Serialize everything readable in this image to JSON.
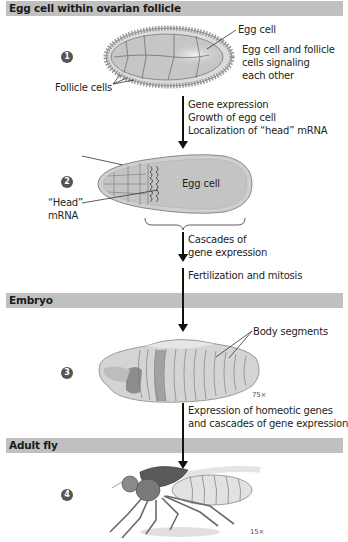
{
  "sections": [
    {
      "title": "Egg cell within ovarian follicle"
    },
    {
      "title": "Embryo"
    },
    {
      "title": "Adult fly"
    }
  ],
  "steps": [
    {
      "number": "1",
      "labels": {
        "egg_cell": "Egg cell",
        "signaling": [
          "Egg cell and follicle",
          "cells signaling",
          "each other"
        ],
        "follicle_cells": "Follicle cells"
      }
    },
    {
      "number": "2",
      "labels": {
        "egg_cell": "Egg cell",
        "head_mrna": [
          "“Head”",
          "mRNA"
        ]
      }
    },
    {
      "number": "3",
      "labels": {
        "body_segments": "Body segments",
        "magnification": "75×"
      }
    },
    {
      "number": "4",
      "labels": {
        "magnification": "15×"
      }
    }
  ],
  "transitions": [
    {
      "lines": [
        "Gene expression",
        "Growth of egg cell",
        "Localization of “head” mRNA"
      ]
    },
    {
      "lines": [
        "Cascades of",
        "gene expression"
      ]
    },
    {
      "lines": [
        "Fertilization and mitosis"
      ]
    },
    {
      "lines": [
        "Expression of homeotic genes",
        "and cascades of gene expression"
      ]
    }
  ],
  "colors": {
    "section_bar": "#c0c0c0",
    "step_badge": "#555555",
    "cell_fill": "#c8c8c8",
    "arrow": "#111111"
  }
}
